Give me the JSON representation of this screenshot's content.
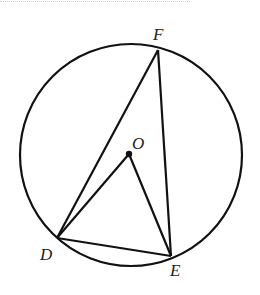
{
  "figure": {
    "type": "circle geometry diagram",
    "circle": {
      "center_label": "O",
      "cx": 131,
      "cy": 155,
      "r": 111
    },
    "points": {
      "F": {
        "label": "F",
        "x": 158,
        "y": 50
      },
      "D": {
        "label": "D",
        "x": 57,
        "y": 238
      },
      "E": {
        "label": "E",
        "x": 171,
        "y": 256
      },
      "O": {
        "label": "O",
        "x": 129,
        "y": 154
      }
    },
    "segments": [
      "DF",
      "EF",
      "DE",
      "OD",
      "OE"
    ],
    "colors": {
      "stroke": "#111111",
      "background": "#ffffff"
    }
  }
}
